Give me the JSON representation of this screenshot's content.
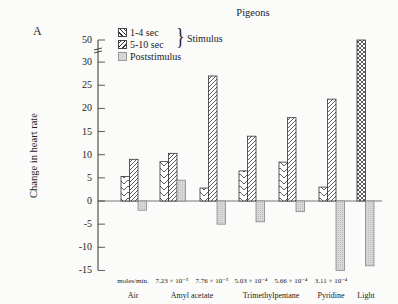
{
  "panel_label": "A",
  "chart_data": {
    "type": "bar",
    "title": "Pigeons",
    "xlabel": "",
    "ylabel": "Change in heart rate",
    "ylim": [
      -15,
      50
    ],
    "y_axis_break": "between 30 and 50",
    "y_ticks": [
      50,
      30,
      25,
      20,
      15,
      10,
      5,
      0,
      -5,
      -10,
      -15
    ],
    "grid": false,
    "legend_position": "top-left",
    "legend": [
      "1-4 sec",
      "5-10 sec",
      "Poststimulus"
    ],
    "legend_group_label": "Stimulus",
    "categories": [
      {
        "group": "Air",
        "concentration": "moles/min."
      },
      {
        "group": "Amyl acetate",
        "concentration": "7.23 × 10⁻⁵"
      },
      {
        "group": "Amyl acetate",
        "concentration": "7.76 × 10⁻⁵"
      },
      {
        "group": "Trimethylpentane",
        "concentration": "5.03 × 10⁻⁴"
      },
      {
        "group": "Trimethylpentane",
        "concentration": "5.66 × 10⁻⁴"
      },
      {
        "group": "Pyridine",
        "concentration": "3.11 × 10⁻⁴"
      },
      {
        "group": "Light",
        "concentration": ""
      }
    ],
    "series": [
      {
        "name": "1-4 sec",
        "pattern": "backslash-hatch",
        "values": [
          5.3,
          8.5,
          2.8,
          6.5,
          8.4,
          3,
          null
        ]
      },
      {
        "name": "5-10 sec",
        "pattern": "slash-hatch",
        "values": [
          9,
          10.3,
          27,
          14,
          18,
          22,
          null
        ]
      },
      {
        "name": "Light stimulus",
        "pattern": "crosshatch",
        "values": [
          null,
          null,
          null,
          null,
          null,
          null,
          50
        ]
      },
      {
        "name": "Poststimulus",
        "pattern": "stipple",
        "values": [
          -2,
          4.5,
          -5,
          -4.5,
          -2.3,
          -15,
          -14
        ]
      }
    ]
  },
  "x_labels": {
    "concentrations": [
      "moles/min.",
      "7.23 × 10⁻⁵",
      "7.76 × 10⁻⁵",
      "5.03 × 10⁻⁴",
      "5.66 × 10⁻⁴",
      "3.11 × 10⁻⁴"
    ],
    "groups": [
      "Air",
      "Amyl acetate",
      "Trimethylpentane",
      "Pyridine",
      "Light"
    ]
  }
}
